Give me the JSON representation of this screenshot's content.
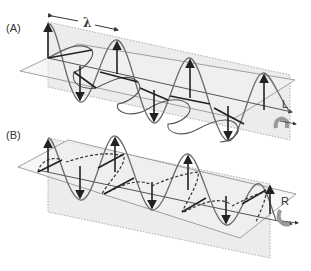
{
  "figure": {
    "panels": [
      {
        "id": "A",
        "label": "(A)",
        "wavelength_symbol": "λ",
        "handedness_label": "L",
        "rotation_icon": "counterclockwise-rotation-arrow",
        "description": "Left circularly polarized wave"
      },
      {
        "id": "B",
        "label": "(B)",
        "handedness_label": "R",
        "rotation_icon": "clockwise-rotation-arrow",
        "description": "Right circularly polarized wave"
      }
    ],
    "colors": {
      "plane_fill": "#ececec",
      "plane_edge": "#8a8a8a",
      "wave_curve": "#6a6a6a",
      "vectors": "#222222",
      "rotation_arrow": "#9a9a9a",
      "background": "#ffffff"
    }
  }
}
